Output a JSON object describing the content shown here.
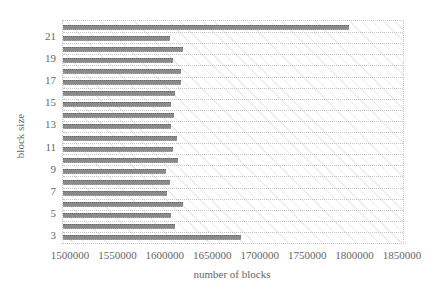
{
  "chart_data": {
    "type": "bar",
    "orientation": "horizontal",
    "title": "",
    "xlabel": "number of blocks",
    "ylabel": "block size",
    "xlim": [
      1500000,
      1850000
    ],
    "x_ticks": [
      "1500000",
      "1550000",
      "1600000",
      "1650000",
      "1700000",
      "1750000",
      "1800000",
      "1850000"
    ],
    "y_tick_labels": [
      "3",
      "5",
      "7",
      "9",
      "11",
      "13",
      "15",
      "17",
      "19",
      "21"
    ],
    "categories": [
      3,
      4,
      5,
      6,
      7,
      8,
      9,
      10,
      11,
      12,
      13,
      14,
      15,
      16,
      17,
      18,
      19,
      20,
      21,
      22
    ],
    "values": [
      1683000,
      1615000,
      1611000,
      1624000,
      1607000,
      1610000,
      1606000,
      1618000,
      1613000,
      1617000,
      1611000,
      1614000,
      1611000,
      1615000,
      1621000,
      1621000,
      1613000,
      1624000,
      1610000,
      1794000
    ],
    "grid": true,
    "legend": null
  }
}
